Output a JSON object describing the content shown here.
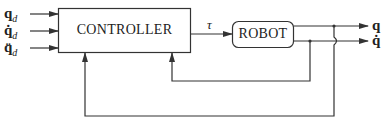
{
  "diagram": {
    "type": "block-diagram",
    "title": "",
    "inputs": [
      {
        "symbol": "q",
        "subscript": "d",
        "display": "q_d"
      },
      {
        "symbol": "q̇",
        "subscript": "d",
        "display": "q̇_d"
      },
      {
        "symbol": "q̈",
        "subscript": "d",
        "display": "q̈_d"
      }
    ],
    "blocks": {
      "controller": {
        "label": "CONTROLLER"
      },
      "robot": {
        "label": "ROBOT"
      }
    },
    "signals": {
      "control": "τ"
    },
    "outputs": [
      {
        "symbol": "q"
      },
      {
        "symbol": "q̇"
      }
    ],
    "feedback": [
      {
        "from": "q̇",
        "to": "controller",
        "label": ""
      },
      {
        "from": "q",
        "to": "controller",
        "label": ""
      }
    ],
    "colors": {
      "line": "#333333",
      "text": "#222222",
      "background": "#ffffff"
    }
  }
}
